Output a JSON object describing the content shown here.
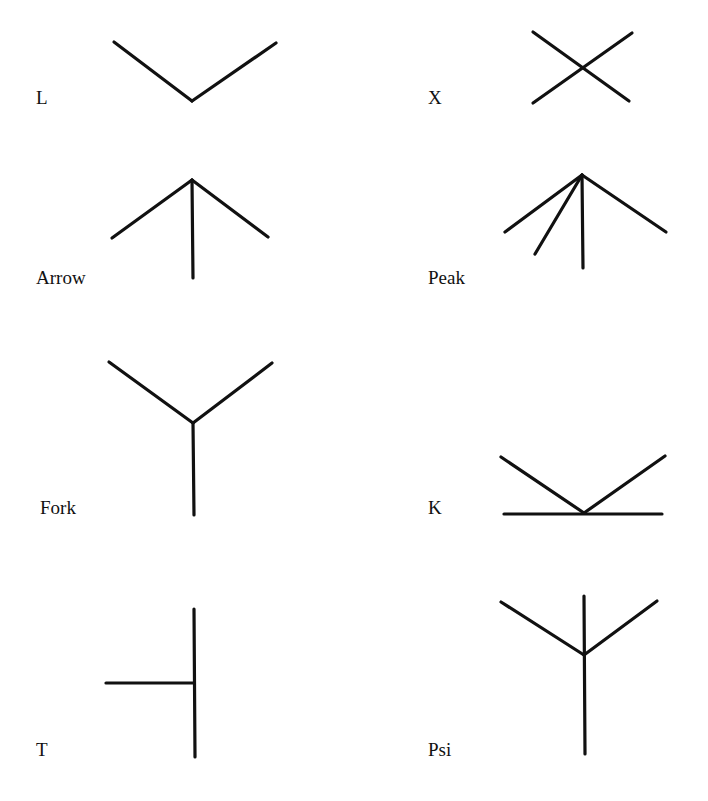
{
  "figure": {
    "junctions": [
      {
        "name": "L",
        "label": "L",
        "label_pos": [
          36,
          88
        ],
        "lines": [
          [
            114,
            42,
            192,
            101
          ],
          [
            192,
            101,
            276,
            43
          ]
        ]
      },
      {
        "name": "X",
        "label": "X",
        "label_pos": [
          428,
          88
        ],
        "lines": [
          [
            533,
            32,
            629,
            101
          ],
          [
            533,
            103,
            632,
            33
          ]
        ]
      },
      {
        "name": "Arrow",
        "label": "Arrow",
        "label_pos": [
          36,
          268
        ],
        "lines": [
          [
            112,
            238,
            192,
            180
          ],
          [
            192,
            180,
            268,
            237
          ],
          [
            192,
            180,
            193,
            278
          ]
        ]
      },
      {
        "name": "Peak",
        "label": "Peak",
        "label_pos": [
          428,
          268
        ],
        "lines": [
          [
            505,
            232,
            582,
            175
          ],
          [
            535,
            254,
            582,
            175
          ],
          [
            582,
            175,
            583,
            268
          ],
          [
            582,
            175,
            666,
            232
          ]
        ]
      },
      {
        "name": "Fork",
        "label": "Fork",
        "label_pos": [
          40,
          498
        ],
        "lines": [
          [
            109,
            362,
            193,
            423
          ],
          [
            193,
            423,
            272,
            363
          ],
          [
            193,
            423,
            194,
            515
          ]
        ]
      },
      {
        "name": "K",
        "label": "K",
        "label_pos": [
          428,
          498
        ],
        "lines": [
          [
            501,
            457,
            584,
            513
          ],
          [
            584,
            513,
            665,
            456
          ],
          [
            504,
            514,
            662,
            514
          ]
        ]
      },
      {
        "name": "T",
        "label": "T",
        "label_pos": [
          36,
          740
        ],
        "lines": [
          [
            194,
            609,
            195,
            757
          ],
          [
            106,
            683,
            194,
            683
          ]
        ]
      },
      {
        "name": "Psi",
        "label": "Psi",
        "label_pos": [
          428,
          740
        ],
        "lines": [
          [
            501,
            602,
            584,
            655
          ],
          [
            584,
            655,
            657,
            601
          ],
          [
            584,
            596,
            585,
            754
          ]
        ]
      }
    ]
  },
  "labels": {
    "L": "L",
    "X": "X",
    "Arrow": "Arrow",
    "Peak": "Peak",
    "Fork": "Fork",
    "K": "K",
    "T": "T",
    "Psi": "Psi"
  },
  "colors": {
    "stroke": "#111111",
    "background": "#ffffff"
  }
}
